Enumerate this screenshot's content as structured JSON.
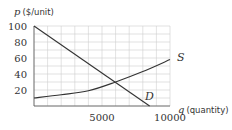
{
  "chart_data": {
    "type": "line",
    "title": "",
    "xlabel": "q (quantity)",
    "ylabel": "p ($/unit)",
    "xlabel_var": "q",
    "xlabel_unit": "(quantity)",
    "ylabel_var": "p",
    "ylabel_unit": "($/unit)",
    "xlim": [
      0,
      10000
    ],
    "ylim": [
      0,
      100
    ],
    "x_ticks": [
      5000,
      10000
    ],
    "y_ticks": [
      20,
      40,
      60,
      80,
      100
    ],
    "grid": {
      "on": true,
      "x_step": 1000,
      "y_step": 10
    },
    "series": [
      {
        "name": "D",
        "label": "D",
        "kind": "demand (linear, decreasing)",
        "points": [
          [
            0,
            100
          ],
          [
            8500,
            0
          ]
        ]
      },
      {
        "name": "S",
        "label": "S",
        "kind": "supply (increasing, convex)",
        "points": [
          [
            0,
            10
          ],
          [
            2000,
            14
          ],
          [
            4000,
            19
          ],
          [
            6000,
            30
          ],
          [
            8000,
            43
          ],
          [
            10000,
            58
          ]
        ]
      }
    ],
    "intersection": {
      "q": 6000,
      "p": 30
    },
    "colors": {
      "curve": "#333333",
      "grid": "#cfcfcf"
    }
  },
  "labels": {
    "y_axis_var": "p",
    "y_axis_unit": "($/unit)",
    "x_axis_var": "q",
    "x_axis_unit": "(quantity)",
    "y_ticks": [
      "100",
      "80",
      "60",
      "40",
      "20"
    ],
    "x_ticks": [
      "5000",
      "10000"
    ],
    "curve_s": "S",
    "curve_d": "D"
  }
}
